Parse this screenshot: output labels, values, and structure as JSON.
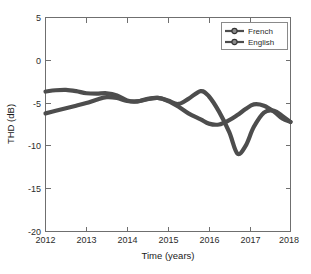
{
  "chart_data": {
    "type": "line",
    "title": "",
    "xlabel": "Time (years)",
    "ylabel": "THD (dB)",
    "xlim": [
      2012,
      2018
    ],
    "ylim": [
      -20,
      5
    ],
    "xticks": [
      "2012",
      "2013",
      "2014",
      "2015",
      "2016",
      "2017",
      "2018"
    ],
    "yticks": [
      "5",
      "0",
      "-5",
      "-10",
      "-15",
      "-20"
    ],
    "grid": false,
    "legend_position": "top-right",
    "series": [
      {
        "name": "French",
        "color": "#4d4d4d",
        "marker": "circle",
        "x": [
          2012.0,
          2012.25,
          2012.5,
          2012.75,
          2013.0,
          2013.25,
          2013.5,
          2013.75,
          2014.0,
          2014.25,
          2014.5,
          2014.75,
          2015.0,
          2015.25,
          2015.5,
          2015.8,
          2016.0,
          2016.25,
          2016.5,
          2016.7,
          2016.9,
          2017.1,
          2017.35,
          2017.6,
          2017.8,
          2018.0
        ],
        "values": [
          -3.65,
          -3.5,
          -3.45,
          -3.6,
          -3.85,
          -3.9,
          -3.85,
          -4.1,
          -4.7,
          -4.8,
          -4.5,
          -4.4,
          -4.7,
          -5.1,
          -4.5,
          -3.6,
          -4.2,
          -6.0,
          -8.4,
          -10.9,
          -10.0,
          -7.8,
          -6.1,
          -5.9,
          -6.5,
          -7.2
        ]
      },
      {
        "name": "English",
        "color": "#4d4d4d",
        "marker": "circle",
        "x": [
          2012.0,
          2012.25,
          2012.5,
          2012.75,
          2013.0,
          2013.25,
          2013.5,
          2013.75,
          2014.0,
          2014.25,
          2014.5,
          2014.75,
          2015.0,
          2015.25,
          2015.5,
          2015.8,
          2016.0,
          2016.25,
          2016.5,
          2016.7,
          2016.9,
          2017.1,
          2017.35,
          2017.6,
          2017.8,
          2018.0
        ],
        "values": [
          -6.2,
          -5.9,
          -5.6,
          -5.3,
          -5.0,
          -4.6,
          -4.3,
          -4.4,
          -4.75,
          -4.8,
          -4.55,
          -4.4,
          -4.75,
          -5.4,
          -6.2,
          -6.9,
          -7.4,
          -7.5,
          -7.0,
          -6.4,
          -5.7,
          -5.15,
          -5.3,
          -6.0,
          -6.8,
          -7.2
        ]
      }
    ]
  },
  "legend": {
    "entries": [
      {
        "label": "French"
      },
      {
        "label": "English"
      }
    ]
  }
}
